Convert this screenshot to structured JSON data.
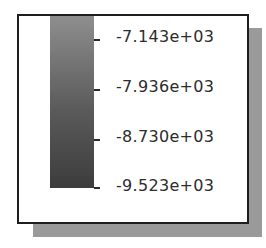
{
  "colorbar": {
    "orientation": "vertical",
    "gradient_top_color": "#8e8e8e",
    "gradient_mid_color": "#5a5a5a",
    "gradient_bottom_color": "#3c3c3c",
    "ticks": [
      {
        "label": "-7.143e+03",
        "value": -7143
      },
      {
        "label": "-7.936e+03",
        "value": -7936
      },
      {
        "label": "-8.730e+03",
        "value": -8730
      },
      {
        "label": "-9.523e+03",
        "value": -9523
      }
    ]
  },
  "colors": {
    "frame_border": "#1e1e1e",
    "shadow": "#9a9a9a",
    "background": "#ffffff",
    "text": "#2c2c2c"
  }
}
